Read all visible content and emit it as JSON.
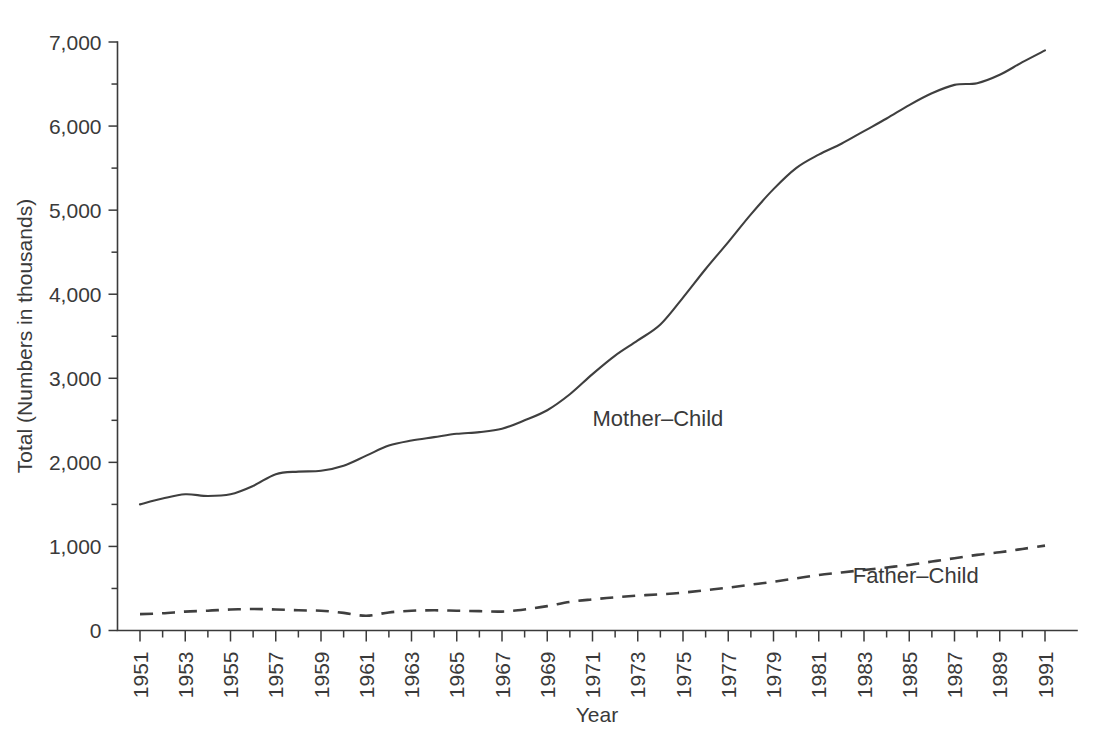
{
  "chart_data": {
    "type": "line",
    "title": "",
    "xlabel": "Year",
    "ylabel": "Total (Numbers in thousands)",
    "xlim": [
      1951,
      1991
    ],
    "ylim": [
      0,
      7000
    ],
    "grid": false,
    "legend_position": "inline-annotation",
    "y_ticks_major": [
      0,
      1000,
      2000,
      3000,
      4000,
      5000,
      6000,
      7000
    ],
    "y_tick_labels": [
      "0",
      "1,000",
      "2,000",
      "3,000",
      "4,000",
      "5,000",
      "6,000",
      "7,000"
    ],
    "y_ticks_minor": [
      500,
      1500,
      2500,
      3500,
      4500,
      5500,
      6500
    ],
    "x_ticks_major": [
      1951,
      1953,
      1955,
      1957,
      1959,
      1961,
      1963,
      1965,
      1967,
      1969,
      1971,
      1973,
      1975,
      1977,
      1979,
      1981,
      1983,
      1985,
      1987,
      1989,
      1991
    ],
    "x_tick_labels": [
      "1951",
      "1953",
      "1955",
      "1957",
      "1959",
      "1961",
      "1963",
      "1965",
      "1967",
      "1969",
      "1971",
      "1973",
      "1975",
      "1977",
      "1979",
      "1981",
      "1983",
      "1985",
      "1987",
      "1989",
      "1991"
    ],
    "x_ticks_minor": [
      1952,
      1954,
      1956,
      1958,
      1960,
      1962,
      1964,
      1966,
      1968,
      1970,
      1972,
      1974,
      1976,
      1978,
      1980,
      1982,
      1984,
      1986,
      1988,
      1990
    ],
    "x": [
      1951,
      1952,
      1953,
      1954,
      1955,
      1956,
      1957,
      1958,
      1959,
      1960,
      1961,
      1962,
      1963,
      1964,
      1965,
      1966,
      1967,
      1968,
      1969,
      1970,
      1971,
      1972,
      1973,
      1974,
      1975,
      1976,
      1977,
      1978,
      1979,
      1980,
      1981,
      1982,
      1983,
      1984,
      1985,
      1986,
      1987,
      1988,
      1989,
      1990,
      1991
    ],
    "series": [
      {
        "name": "Mother-Child",
        "label": "Mother–Child",
        "style": "solid",
        "color": "#3f3f3f",
        "label_x": 1971,
        "label_y": 2430,
        "values": [
          1500,
          1570,
          1620,
          1600,
          1620,
          1720,
          1860,
          1890,
          1900,
          1960,
          2080,
          2200,
          2260,
          2300,
          2340,
          2360,
          2400,
          2500,
          2620,
          2810,
          3050,
          3270,
          3450,
          3640,
          3960,
          4300,
          4620,
          4950,
          5250,
          5500,
          5660,
          5790,
          5940,
          6090,
          6250,
          6390,
          6490,
          6510,
          6610,
          6760,
          6900
        ]
      },
      {
        "name": "Father-Child",
        "label": "Father–Child",
        "style": "dashed",
        "color": "#3f3f3f",
        "label_x": 1982.5,
        "label_y": 560,
        "values": [
          195,
          205,
          225,
          235,
          250,
          255,
          250,
          240,
          235,
          210,
          175,
          215,
          235,
          240,
          235,
          230,
          225,
          250,
          290,
          340,
          370,
          395,
          415,
          430,
          450,
          480,
          510,
          545,
          580,
          620,
          660,
          690,
          720,
          750,
          780,
          820,
          860,
          900,
          930,
          970,
          1010
        ]
      }
    ]
  },
  "axes": {
    "y_title": "Total (Numbers in thousands)",
    "x_title": "Year"
  }
}
